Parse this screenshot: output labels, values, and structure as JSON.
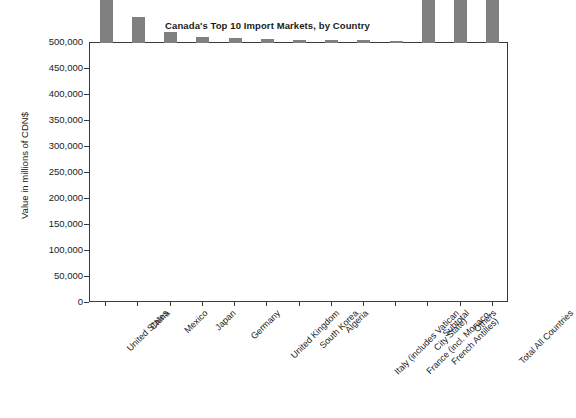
{
  "chart_data": {
    "type": "bar",
    "title": "Canada's Top 10 Import Markets, by Country",
    "xlabel": "",
    "ylabel": "Value in millions of CDN$",
    "ylim": [
      0,
      500000
    ],
    "grid": false,
    "legend": "none",
    "bar_color": "#808080",
    "ytick_labels": [
      "500,000",
      "450,000",
      "400,000",
      "350,000",
      "300,000",
      "250,000",
      "200,000",
      "150,000",
      "100,000",
      "50,000",
      "0"
    ],
    "ytick_values": [
      500000,
      450000,
      400000,
      350000,
      300000,
      250000,
      200000,
      150000,
      100000,
      50000,
      0
    ],
    "categories": [
      "United States",
      "China",
      "Mexico",
      "Japan",
      "Germany",
      "United Kingdom",
      "South Korea",
      "Algeria",
      "Italy (includes Vatican\nCity State)",
      "France (incl. Monaco,\nFrench Antilles)",
      "Subtotal",
      "Others",
      "Total All Countries"
    ],
    "values": [
      234000,
      50500,
      22000,
      12000,
      10500,
      8000,
      6000,
      5500,
      5000,
      4500,
      370000,
      89000,
      459000
    ]
  }
}
